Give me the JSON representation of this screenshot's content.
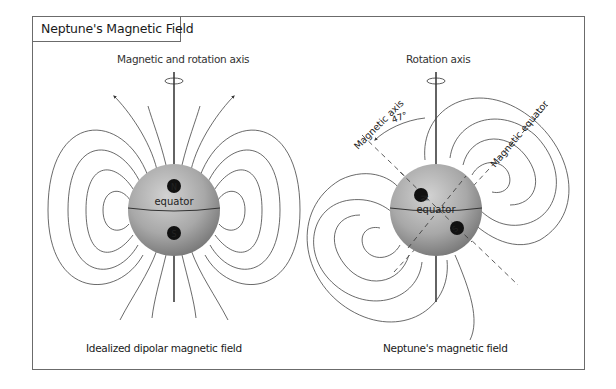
{
  "title": "Neptune's Magnetic Field",
  "left_panel": {
    "axis_label": "Magnetic and rotation axis",
    "equator_label": "equator",
    "north_pole": "N",
    "south_pole": "S",
    "caption": "Idealized dipolar magnetic field"
  },
  "right_panel": {
    "axis_label": "Rotation axis",
    "magnetic_axis_label": "Magnetic axis",
    "magnetic_equator_label": "Magnetic equator",
    "tilt_angle": "47°",
    "equator_label": "equator",
    "north_pole": "N",
    "south_pole": "S",
    "caption": "Neptune's magnetic field"
  },
  "colors": {
    "frame": "#6b6b6b",
    "sphere_light": "#c4c4c4",
    "sphere_dark": "#6e6e6e",
    "field_line": "#333333",
    "pole_badge": "#111111"
  }
}
